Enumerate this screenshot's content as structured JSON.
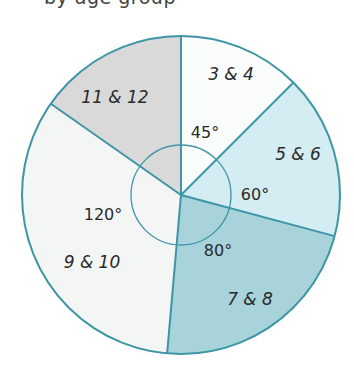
{
  "chart_data": {
    "type": "pie",
    "title": "",
    "unit": "degrees",
    "start_angle_deg_clockwise_from_top": 0,
    "stroke_color": "#3e95a6",
    "slices": [
      {
        "label": "3 & 4",
        "value": 45,
        "angle_label": "45°",
        "color": "#fbfdfd"
      },
      {
        "label": "5 & 6",
        "value": 60,
        "angle_label": "60°",
        "color": "#d4edf2"
      },
      {
        "label": "7 & 8",
        "value": 80,
        "angle_label": "80°",
        "color": "#a9d3db"
      },
      {
        "label": "9 & 10",
        "value": 120,
        "angle_label": "120°",
        "color": "#f4f5f5"
      },
      {
        "label": "11 & 12",
        "value": 55,
        "angle_label": "",
        "color": "#d9d9d9"
      }
    ],
    "legend": "none"
  },
  "page": {
    "clipped_title": "by age group"
  }
}
